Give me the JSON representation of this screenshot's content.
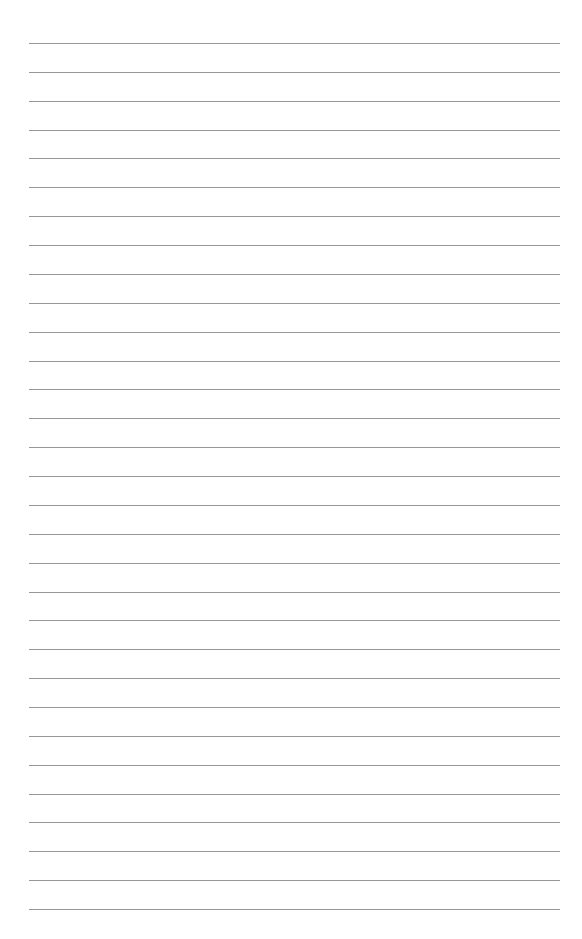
{
  "page": {
    "type": "lined-paper",
    "background_color": "#ffffff",
    "rule_color": "#8c8c8c",
    "rule_count": 31,
    "first_rule_y": 43,
    "rule_spacing": 28.87,
    "rule_left": 29,
    "rule_right": 560
  }
}
